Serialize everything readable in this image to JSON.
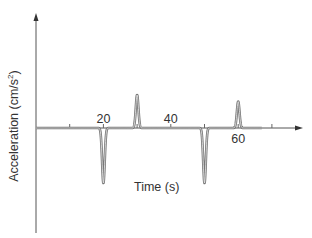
{
  "chart_data": {
    "type": "line",
    "title": "",
    "xlabel": "Time (s)",
    "ylabel": "Acceleration (cm/s²)",
    "ylabel_main": "Acceleration (cm/s",
    "ylabel_sup": "2",
    "ylabel_close": ")",
    "x_tick_labels": [
      {
        "value": 20,
        "label": "20",
        "position": "above"
      },
      {
        "value": 40,
        "label": "40",
        "position": "above"
      },
      {
        "value": 60,
        "label": "60",
        "position": "below"
      }
    ],
    "x_ticks": [
      10,
      20,
      30,
      40,
      50,
      60,
      70
    ],
    "xlim": [
      0,
      78
    ],
    "ylim": [
      -1,
      1
    ],
    "grid": false,
    "legend": null,
    "series": [
      {
        "name": "acceleration",
        "color": "#707070",
        "description": "Zero baseline with narrow pulses: negative at t=20, positive at t=30, negative at t=50, positive at t=60",
        "pulses": [
          {
            "t": 20,
            "amplitude": -1.0
          },
          {
            "t": 30,
            "amplitude": 0.6
          },
          {
            "t": 50,
            "amplitude": -1.0
          },
          {
            "t": 60,
            "amplitude": 0.48
          }
        ],
        "t_start": 0,
        "t_end": 67
      }
    ],
    "axis_color": "#444444"
  }
}
